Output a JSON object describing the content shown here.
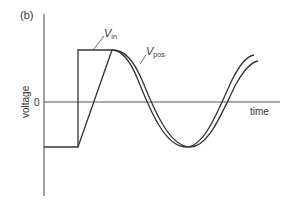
{
  "figure": {
    "panel_label": "(b)",
    "y_axis_label": "voltage",
    "x_axis_label": "time",
    "zero_tick_label": "0",
    "curves": [
      {
        "name": "V_in",
        "label_main": "V",
        "label_sub": "in"
      },
      {
        "name": "V_pos",
        "label_main": "V",
        "label_sub": "pos"
      }
    ],
    "colors": {
      "line": "#333333",
      "axis": "#444444"
    }
  }
}
